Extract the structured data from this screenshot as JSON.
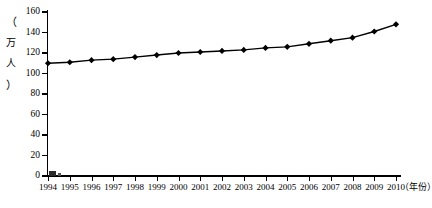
{
  "chart_data": {
    "type": "line",
    "title": "",
    "subtitle": "",
    "xlabel": "（年份）",
    "ylabel": "（万人）",
    "ylim": [
      0,
      160
    ],
    "ytick_values": [
      0,
      20,
      40,
      60,
      80,
      100,
      120,
      140,
      160
    ],
    "ytick_labels": [
      "0",
      "20",
      "40",
      "60",
      "80",
      "100",
      "120",
      "140",
      "160"
    ],
    "grid": false,
    "legend": false,
    "legend_position": "none",
    "marker": "diamond",
    "line_color": "#000000",
    "marker_color": "#000000",
    "categories": [
      "1994",
      "1995",
      "1996",
      "1997",
      "1998",
      "1999",
      "2000",
      "2001",
      "2002",
      "2003",
      "2004",
      "2005",
      "2006",
      "2007",
      "2008",
      "2009",
      "2010"
    ],
    "values": [
      110,
      111,
      113,
      114,
      116,
      118,
      120,
      121,
      122,
      123,
      125,
      126,
      129,
      132,
      135,
      141,
      148
    ],
    "series": [
      {
        "name": "人口数",
        "values": [
          110,
          111,
          113,
          114,
          116,
          118,
          120,
          121,
          122,
          123,
          125,
          126,
          129,
          132,
          135,
          141,
          148
        ]
      }
    ]
  },
  "axes": {
    "y_caption_chars": [
      "（",
      "万",
      "人",
      "）"
    ],
    "x_caption": "（年份）"
  },
  "colors": {
    "background": "#ffffff",
    "foreground": "#000000",
    "series": "#000000"
  }
}
